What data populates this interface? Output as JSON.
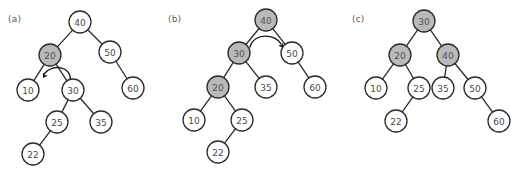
{
  "figure": {
    "background_color": "#ffffff",
    "node_fill": "#ffffff",
    "node_highlight_fill": "#b9b9b9",
    "node_stroke": "#2b2b2b",
    "text_color": "#4a4a4a",
    "arrow_color": "#1a1a1a"
  },
  "panels": [
    {
      "label": "(a)",
      "label_x": 8,
      "label_y": 14,
      "origin_x": 0,
      "node_radius": 11,
      "nodes": [
        {
          "id": "a40",
          "value": "40",
          "x": 80,
          "y": 22,
          "highlight": false
        },
        {
          "id": "a20",
          "value": "20",
          "x": 50,
          "y": 55,
          "highlight": true
        },
        {
          "id": "a50",
          "value": "50",
          "x": 110,
          "y": 52,
          "highlight": false
        },
        {
          "id": "a10",
          "value": "10",
          "x": 28,
          "y": 90,
          "highlight": false
        },
        {
          "id": "a30",
          "value": "30",
          "x": 73,
          "y": 90,
          "highlight": false
        },
        {
          "id": "a60",
          "value": "60",
          "x": 133,
          "y": 88,
          "highlight": false
        },
        {
          "id": "a25",
          "value": "25",
          "x": 57,
          "y": 122,
          "highlight": false
        },
        {
          "id": "a35",
          "value": "35",
          "x": 101,
          "y": 122,
          "highlight": false
        },
        {
          "id": "a22",
          "value": "22",
          "x": 33,
          "y": 154,
          "highlight": false
        }
      ],
      "edges": [
        [
          "a40",
          "a20"
        ],
        [
          "a40",
          "a50"
        ],
        [
          "a20",
          "a10"
        ],
        [
          "a20",
          "a30"
        ],
        [
          "a50",
          "a60"
        ],
        [
          "a30",
          "a25"
        ],
        [
          "a30",
          "a35"
        ],
        [
          "a25",
          "a22"
        ]
      ],
      "arrow": {
        "present": true,
        "direction": "counterclockwise",
        "meaning": "right-rotation",
        "path": "M 70 82 C 73 66, 52 63, 44 74",
        "head_x": 43,
        "head_y": 78,
        "head_rotation": 122
      }
    },
    {
      "label": "(b)",
      "label_x": 168,
      "label_y": 14,
      "origin_x": 170,
      "node_radius": 11,
      "nodes": [
        {
          "id": "b40",
          "value": "40",
          "x": 266,
          "y": 20,
          "highlight": true
        },
        {
          "id": "b30",
          "value": "30",
          "x": 239,
          "y": 53,
          "highlight": true
        },
        {
          "id": "b50",
          "value": "50",
          "x": 292,
          "y": 53,
          "highlight": false
        },
        {
          "id": "b20",
          "value": "20",
          "x": 218,
          "y": 87,
          "highlight": true
        },
        {
          "id": "b35",
          "value": "35",
          "x": 266,
          "y": 87,
          "highlight": false
        },
        {
          "id": "b60",
          "value": "60",
          "x": 315,
          "y": 87,
          "highlight": false
        },
        {
          "id": "b10",
          "value": "10",
          "x": 194,
          "y": 120,
          "highlight": false
        },
        {
          "id": "b25",
          "value": "25",
          "x": 242,
          "y": 120,
          "highlight": false
        },
        {
          "id": "b22",
          "value": "22",
          "x": 218,
          "y": 152,
          "highlight": false
        }
      ],
      "edges": [
        [
          "b40",
          "b30"
        ],
        [
          "b40",
          "b50"
        ],
        [
          "b30",
          "b20"
        ],
        [
          "b30",
          "b35"
        ],
        [
          "b50",
          "b60"
        ],
        [
          "b20",
          "b10"
        ],
        [
          "b20",
          "b25"
        ],
        [
          "b25",
          "b22"
        ]
      ],
      "arrow": {
        "present": true,
        "direction": "clockwise",
        "meaning": "left-rotation",
        "path": "M 250 47 C 254 32, 276 34, 281 44",
        "head_x": 283,
        "head_y": 48,
        "head_rotation": 60
      }
    },
    {
      "label": "(c)",
      "label_x": 352,
      "label_y": 14,
      "origin_x": 345,
      "node_radius": 11,
      "nodes": [
        {
          "id": "c30",
          "value": "30",
          "x": 424,
          "y": 21,
          "highlight": true
        },
        {
          "id": "c20",
          "value": "20",
          "x": 400,
          "y": 55,
          "highlight": true
        },
        {
          "id": "c40",
          "value": "40",
          "x": 448,
          "y": 55,
          "highlight": true
        },
        {
          "id": "c10",
          "value": "10",
          "x": 376,
          "y": 88,
          "highlight": false
        },
        {
          "id": "c25",
          "value": "25",
          "x": 419,
          "y": 88,
          "highlight": false
        },
        {
          "id": "c35",
          "value": "35",
          "x": 443,
          "y": 88,
          "highlight": false
        },
        {
          "id": "c50",
          "value": "50",
          "x": 475,
          "y": 88,
          "highlight": false
        },
        {
          "id": "c22",
          "value": "22",
          "x": 396,
          "y": 121,
          "highlight": false
        },
        {
          "id": "c60",
          "value": "60",
          "x": 499,
          "y": 121,
          "highlight": false
        }
      ],
      "edges": [
        [
          "c30",
          "c20"
        ],
        [
          "c30",
          "c40"
        ],
        [
          "c20",
          "c10"
        ],
        [
          "c20",
          "c25"
        ],
        [
          "c40",
          "c35"
        ],
        [
          "c40",
          "c50"
        ],
        [
          "c25",
          "c22"
        ],
        [
          "c50",
          "c60"
        ]
      ],
      "arrow": {
        "present": false
      }
    }
  ]
}
